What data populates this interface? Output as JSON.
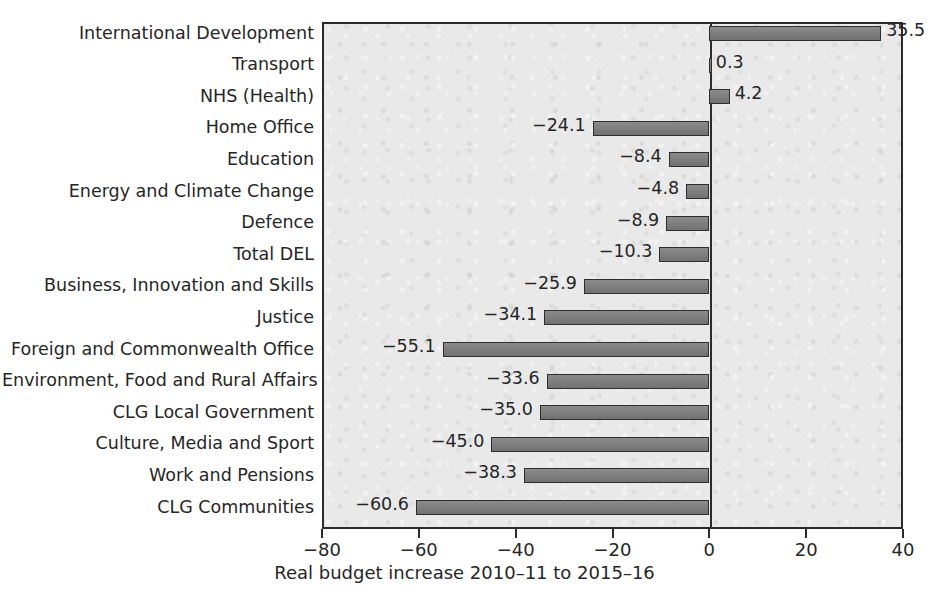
{
  "chart_data": {
    "type": "bar",
    "orientation": "horizontal",
    "title": "",
    "subtitle": "",
    "xlabel": "Real budget increase 2010–11 to 2015–16",
    "ylabel": "",
    "xlim": [
      -80,
      40
    ],
    "ylim": null,
    "xticks": [
      -80,
      -60,
      -40,
      -20,
      0,
      20,
      40
    ],
    "xtick_labels": [
      "−80",
      "−60",
      "−40",
      "−20",
      "0",
      "20",
      "40"
    ],
    "grid": false,
    "legend": null,
    "legend_position": "none",
    "zero_reference_line": 0,
    "categories": [
      "International Development",
      "Transport",
      "NHS (Health)",
      "Home Office",
      "Education",
      "Energy and Climate Change",
      "Defence",
      "Total DEL",
      "Business, Innovation and Skills",
      "Justice",
      "Foreign and Commonwealth Office",
      "Environment, Food and Rural Affairs",
      "CLG Local Government",
      "Culture, Media and Sport",
      "Work and Pensions",
      "CLG Communities"
    ],
    "values": [
      35.5,
      0.3,
      4.2,
      -24.1,
      -8.4,
      -4.8,
      -8.9,
      -10.3,
      -25.9,
      -34.1,
      -55.1,
      -33.6,
      -35.0,
      -45.0,
      -38.3,
      -60.6
    ],
    "value_labels": [
      "35.5",
      "0.3",
      "4.2",
      "−24.1",
      "−8.4",
      "−4.8",
      "−8.9",
      "−10.3",
      "−25.9",
      "−34.1",
      "−55.1",
      "−33.6",
      "−35.0",
      "−45.0",
      "−38.3",
      "−60.6"
    ]
  },
  "style": {
    "bar_fill": "#7e7e7e",
    "bar_edge": "#2e2e2e",
    "plot_background": "#e9e9e9",
    "frame_color": "#2b2b2b",
    "text_color": "#262626",
    "page_background": "#ffffff"
  }
}
